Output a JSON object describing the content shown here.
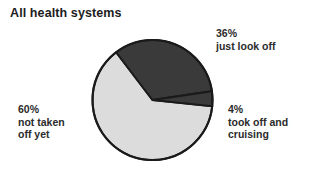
{
  "chart_data": {
    "type": "pie",
    "title": "All health systems",
    "xlabel": "",
    "ylabel": "",
    "categories": [
      "just look off",
      "took off and cruising",
      "not taken off yet"
    ],
    "values": [
      36,
      4,
      60
    ],
    "value_unit": "%",
    "labels": [
      {
        "percent": "36%",
        "text": "just look off",
        "color": "#3a3a3a",
        "position": "top-right"
      },
      {
        "percent": "4%",
        "text": "took off and cruising",
        "color": "#3a3a3a",
        "position": "bottom-right"
      },
      {
        "percent": "60%",
        "text": "not taken off yet",
        "color": "#dcdcdc",
        "position": "left"
      }
    ],
    "legend_position": "outside-callouts",
    "grid": false,
    "colors": {
      "dark_slice": "#3a3a3a",
      "light_slice": "#dcdcdc",
      "outline": "#1a1a1a",
      "background": "#ffffff",
      "text": "#2b2b2b"
    }
  },
  "chart": {
    "title": "All health systems"
  },
  "slices": {
    "just_look_off": {
      "percent": "36%",
      "text": "just look off"
    },
    "took_off_and_cruising": {
      "percent": "4%",
      "text": "took off and cruising"
    },
    "not_taken_off_yet": {
      "percent": "60%",
      "text": "not taken off yet"
    }
  }
}
